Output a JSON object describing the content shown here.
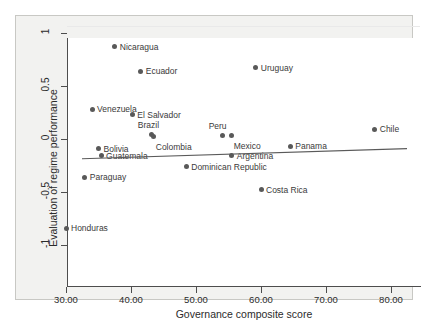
{
  "chart_data": {
    "type": "scatter",
    "title": "",
    "xlabel": "Governance composite score",
    "ylabel": "Evaluation of regime performance",
    "xlim": [
      28.5,
      82.0
    ],
    "ylim": [
      -1.1,
      1.1
    ],
    "xticks": [
      "30.00",
      "40.00",
      "50.00",
      "60.00",
      "70.00",
      "80.00"
    ],
    "xtick_values": [
      30,
      40,
      50,
      60,
      70,
      80
    ],
    "yticks": [
      "1",
      "0.5",
      "0",
      "-0.5",
      "-1"
    ],
    "ytick_values": [
      1,
      0.5,
      0,
      -0.5,
      -1
    ],
    "grid": "horizontal-light",
    "legend": "none",
    "marker_color": "#595959",
    "fit_line_color": "#5a5a5a",
    "points": [
      {
        "label": "Nicaragua",
        "x": 37.5,
        "y": 0.87,
        "label_pos": "right"
      },
      {
        "label": "Ecuador",
        "x": 41.5,
        "y": 0.64,
        "label_pos": "right"
      },
      {
        "label": "Venezuela",
        "x": 34.0,
        "y": 0.28,
        "label_pos": "right"
      },
      {
        "label": "El Salvador",
        "x": 40.2,
        "y": 0.23,
        "label_pos": "right"
      },
      {
        "label": "Uruguay",
        "x": 59.2,
        "y": 0.67,
        "label_pos": "right"
      },
      {
        "label": "Brazil",
        "x": 43.2,
        "y": 0.045,
        "label_pos": "above"
      },
      {
        "label": "Colombia",
        "x": 43.5,
        "y": 0.02,
        "label_pos": "below-right"
      },
      {
        "label": "Peru",
        "x": 54.1,
        "y": 0.035,
        "label_pos": "above"
      },
      {
        "label": "Mexico",
        "x": 55.5,
        "y": 0.03,
        "label_pos": "below-right"
      },
      {
        "label": "Argentina",
        "x": 55.5,
        "y": -0.16,
        "label_pos": "right"
      },
      {
        "label": "Panama",
        "x": 64.5,
        "y": -0.07,
        "label_pos": "right"
      },
      {
        "label": "Chile",
        "x": 77.5,
        "y": 0.09,
        "label_pos": "right"
      },
      {
        "label": "Bolivia",
        "x": 35.0,
        "y": -0.09,
        "label_pos": "right"
      },
      {
        "label": "Guatemala",
        "x": 35.4,
        "y": -0.16,
        "label_pos": "right"
      },
      {
        "label": "Paraguay",
        "x": 32.9,
        "y": -0.36,
        "label_pos": "right"
      },
      {
        "label": "Dominican Republic",
        "x": 48.5,
        "y": -0.26,
        "label_pos": "right"
      },
      {
        "label": "Costa Rica",
        "x": 60.0,
        "y": -0.48,
        "label_pos": "right"
      },
      {
        "label": "Honduras",
        "x": 30.0,
        "y": -0.84,
        "label_pos": "right"
      }
    ],
    "fit_line": {
      "x1": 30.0,
      "y1": -0.035,
      "x2": 80.0,
      "y2": 0.06
    }
  }
}
